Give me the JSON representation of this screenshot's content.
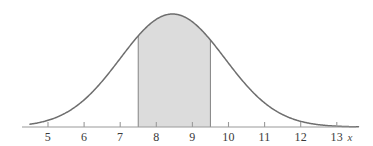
{
  "chart_data": {
    "type": "area",
    "title": "",
    "subtitle": "",
    "xlabel": "x",
    "ylabel": "",
    "grid": false,
    "legend": null,
    "annotations": [],
    "xlim": [
      4.5,
      13.6
    ],
    "ylim": [
      0,
      1
    ],
    "axis_ticks": [
      {
        "value": 5,
        "label": "5"
      },
      {
        "value": 6,
        "label": "6"
      },
      {
        "value": 7,
        "label": "7"
      },
      {
        "value": 8,
        "label": "8"
      },
      {
        "value": 9,
        "label": "9"
      },
      {
        "value": 10,
        "label": "10"
      },
      {
        "value": 11,
        "label": "11"
      },
      {
        "value": 12,
        "label": "12"
      },
      {
        "value": 13,
        "label": "13"
      }
    ],
    "distribution": {
      "name": "normal-density-curve",
      "mean": 8.45,
      "sigma": 1.45,
      "peak_value": 1.0
    },
    "shaded_region": {
      "name": "shaded-area-under-curve",
      "from": 7.5,
      "to": 9.5,
      "fill_color": "#dcdcdc",
      "edge_color": "#8c8c8c"
    },
    "curve_color": "#6e6e6e",
    "axis_color": "#9a9a9a",
    "x": [
      4.5,
      4.8,
      5.0,
      5.3,
      5.6,
      5.9,
      6.2,
      6.5,
      6.8,
      7.1,
      7.4,
      7.5,
      7.7,
      8.0,
      8.3,
      8.45,
      8.6,
      8.9,
      9.2,
      9.5,
      9.8,
      10.1,
      10.4,
      10.7,
      11.0,
      11.3,
      11.6,
      11.9,
      12.2,
      12.5,
      12.8,
      13.1,
      13.4,
      13.6
    ],
    "y": [
      0.012,
      0.021,
      0.031,
      0.048,
      0.072,
      0.105,
      0.148,
      0.202,
      0.266,
      0.338,
      0.414,
      0.44,
      0.492,
      0.569,
      0.635,
      0.66,
      0.676,
      0.69,
      0.672,
      0.625,
      0.553,
      0.467,
      0.376,
      0.289,
      0.212,
      0.148,
      0.099,
      0.063,
      0.038,
      0.022,
      0.012,
      0.006,
      0.003,
      0.002
    ]
  },
  "geometry": {
    "axis_y_px": 127,
    "axis_x_start_px": 22,
    "axis_x_end_px": 356,
    "px_per_unit": 36.1,
    "x5_px": 48,
    "peak_y_px": 14,
    "tick_length_px": 5
  },
  "labels": {
    "axis_variable": "x"
  }
}
